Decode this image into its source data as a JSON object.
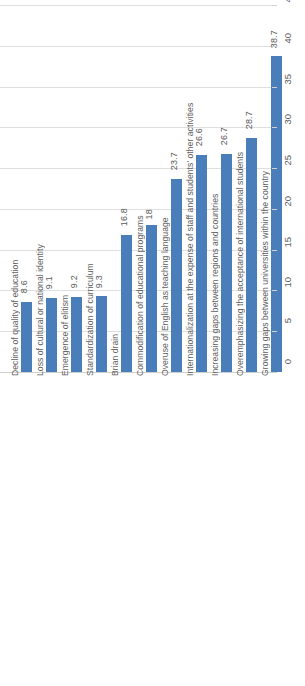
{
  "chart_data": {
    "type": "bar",
    "title": "",
    "subtitle": "",
    "xlabel": "",
    "ylabel": "",
    "orientation": "vertical",
    "grid": true,
    "legend": false,
    "legend_position": "none",
    "axis_position": "right",
    "bar_color": "#4A7EBB",
    "gridline_color": "#DFDFDF",
    "ylim": [
      0,
      45
    ],
    "ytick_step": 5,
    "ytick_labels": [
      "0",
      "5",
      "10",
      "15",
      "20",
      "25",
      "30",
      "35",
      "40",
      "45"
    ],
    "ytick_values": [
      0,
      5,
      10,
      15,
      20,
      25,
      30,
      35,
      40,
      45
    ],
    "categories": [
      "Decline of quality of education",
      "Loss of cultural or national identity",
      "Emergence of elitism",
      "Standardization of curriculum",
      "Brian drain",
      "Commodification of educational programs",
      "Overuse of English as teaching language",
      "Internationalization at the expense of staff and students' other activities",
      "Increasing gaps between regions and countries",
      "Overemphasizing the acceptance of international students",
      "Growing gaps between universities within the country"
    ],
    "values": [
      8.6,
      9.1,
      9.2,
      9.3,
      16.8,
      18,
      23.7,
      26.6,
      26.7,
      28.7,
      38.7
    ],
    "value_labels": [
      "8.6",
      "9.1",
      "9.2",
      "9.3",
      "16.8",
      "18",
      "23.7",
      "26.6",
      "26.7",
      "28.7",
      "38.7"
    ]
  }
}
